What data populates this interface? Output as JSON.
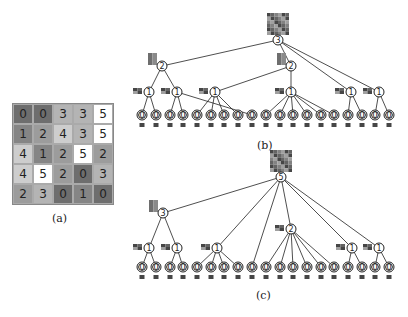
{
  "grid": {
    "caption": "(a)",
    "values": [
      [
        0,
        0,
        3,
        3,
        5
      ],
      [
        1,
        2,
        4,
        3,
        5
      ],
      [
        4,
        1,
        2,
        5,
        2
      ],
      [
        4,
        5,
        2,
        0,
        3
      ],
      [
        2,
        3,
        0,
        1,
        0
      ]
    ],
    "shades": {
      "0": "#6e6e6e",
      "1": "#858585",
      "2": "#9c9c9c",
      "3": "#b4b4b4",
      "4": "#cdcdcd",
      "5": "#ffffff"
    }
  },
  "tree_b": {
    "caption": "(b)",
    "root": {
      "label": "3",
      "x": 278,
      "y": 40
    },
    "level1": [
      {
        "label": "2",
        "x": 162,
        "y": 66
      },
      {
        "label": "2",
        "x": 291,
        "y": 66
      }
    ],
    "level2": [
      {
        "label": "1",
        "x": 149,
        "y": 92,
        "parent": 0
      },
      {
        "label": "1",
        "x": 177,
        "y": 92,
        "parent": 0
      },
      {
        "label": "1",
        "x": 215,
        "y": 92,
        "parent": 1
      },
      {
        "label": "1",
        "x": 291,
        "y": 92,
        "parent": 1
      },
      {
        "label": "1",
        "x": 351,
        "y": 92,
        "parent": "root"
      },
      {
        "label": "1",
        "x": 379,
        "y": 92,
        "parent": "root"
      }
    ],
    "leaves_y": 115,
    "leaf_label": "0",
    "leaf_parents": [
      0,
      0,
      1,
      1,
      2,
      2,
      2,
      2,
      1,
      3,
      3,
      3,
      3,
      3,
      3,
      4,
      4,
      5,
      5
    ]
  },
  "tree_c": {
    "caption": "(c)",
    "root": {
      "label": "5",
      "x": 281,
      "y": 177
    },
    "level1": [
      {
        "label": "3",
        "x": 163,
        "y": 213
      }
    ],
    "level2": [
      {
        "label": "1",
        "x": 149,
        "y": 248,
        "parent": 0
      },
      {
        "label": "1",
        "x": 177,
        "y": 248,
        "parent": 0
      },
      {
        "label": "1",
        "x": 217,
        "y": 248,
        "parent": "root"
      },
      {
        "label": "2",
        "x": 291,
        "y": 229,
        "parent": "root"
      },
      {
        "label": "1",
        "x": 352,
        "y": 248,
        "parent": "root"
      },
      {
        "label": "1",
        "x": 379,
        "y": 248,
        "parent": "root"
      }
    ],
    "leaves_y": 267,
    "leaf_label": "0",
    "leaf_parents": [
      0,
      0,
      1,
      1,
      2,
      2,
      2,
      2,
      "root",
      3,
      3,
      3,
      3,
      3,
      3,
      4,
      4,
      5,
      5
    ]
  },
  "leaves_x": [
    142,
    156,
    170,
    183,
    197,
    211,
    224,
    238,
    252,
    266,
    280,
    293,
    307,
    321,
    334,
    348,
    362,
    375,
    389
  ]
}
